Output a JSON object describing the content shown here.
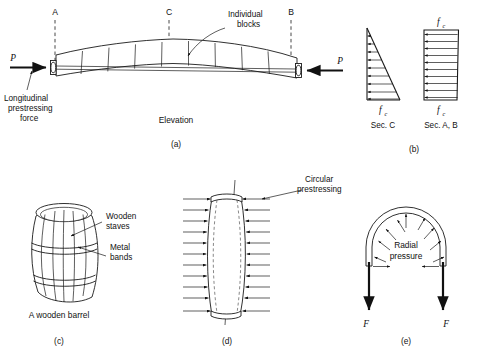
{
  "figure": {
    "background_color": "#ffffff",
    "line_color": "#1a1a1a"
  },
  "panel_a": {
    "caption": "(a)",
    "view_label": "Elevation",
    "section_marks": [
      {
        "label": "A",
        "x": 55
      },
      {
        "label": "C",
        "x": 169
      },
      {
        "label": "B",
        "x": 291
      }
    ],
    "force_left": {
      "symbol": "P",
      "direction": "right"
    },
    "force_right": {
      "symbol": "P",
      "direction": "left"
    },
    "annotations": [
      {
        "name": "longitudinal-prestressing-force",
        "lines": [
          "Longitudinal",
          "prestressing",
          "force"
        ]
      },
      {
        "name": "individual-blocks",
        "lines": [
          "Individual",
          "blocks"
        ]
      }
    ],
    "block_count": 9
  },
  "panel_b": {
    "caption": "(b)",
    "diagrams": [
      {
        "name": "section-c-stress",
        "shape": "triangular",
        "section_label": "Sec. C",
        "stress_symbol": "f",
        "stress_subscript": "c",
        "stress_label_position": "bottom",
        "arrow_count": 9
      },
      {
        "name": "section-ab-stress",
        "shape": "uniform-rectangular",
        "section_label": "Sec. A, B",
        "stress_symbol": "f",
        "stress_subscript": "c",
        "stress_label_position": "top-and-bottom",
        "arrow_count": 10
      }
    ]
  },
  "panel_c": {
    "caption": "(c)",
    "title": "A wooden barrel",
    "annotations": [
      {
        "name": "wooden-staves",
        "lines": [
          "Wooden",
          "staves"
        ]
      },
      {
        "name": "metal-bands",
        "lines": [
          "Metal",
          "bands"
        ]
      }
    ],
    "band_count": 2,
    "stave_count": 6
  },
  "panel_d": {
    "caption": "(d)",
    "annotations": [
      {
        "name": "circular-prestressing",
        "lines": [
          "Circular",
          "prestressing"
        ]
      }
    ],
    "pressure_arrow_rows": 11,
    "arrow_direction": "inward"
  },
  "panel_e": {
    "caption": "(e)",
    "annotations": [
      {
        "name": "radial-pressure",
        "lines": [
          "Radial",
          "pressure"
        ]
      }
    ],
    "force_left": {
      "symbol": "F",
      "direction": "down"
    },
    "force_right": {
      "symbol": "F",
      "direction": "down"
    },
    "radial_arrow_count": 9
  }
}
